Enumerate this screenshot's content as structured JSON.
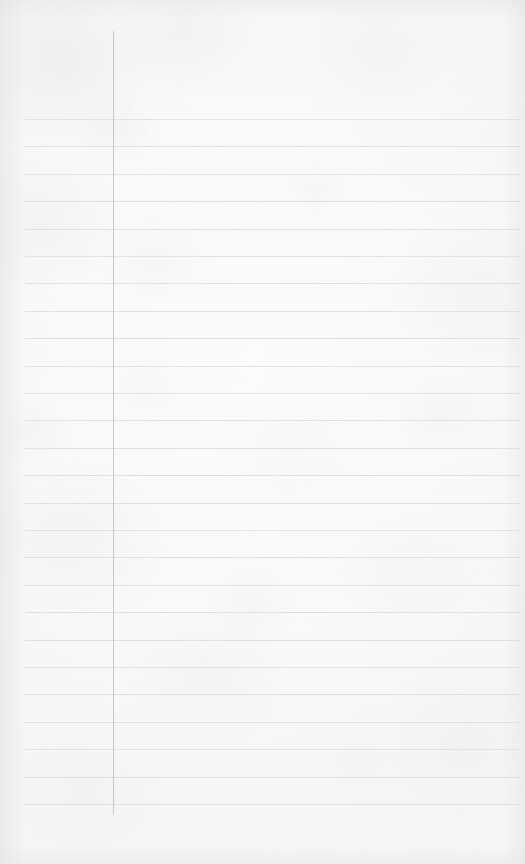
{
  "document": {
    "kind": "scanned-lined-notebook-paper",
    "title": "Blank ruled notebook page",
    "content_text": "",
    "visible_text_count": 0
  },
  "page": {
    "width": 525,
    "height": 864,
    "paper_color": "#fbfbfa",
    "paper_highlight": "#fdfdfd",
    "paper_shadow": "#f2f2f1"
  },
  "ruling": {
    "rule_color": "#d4d6d8",
    "rule_thickness": 1,
    "rule_left": 25,
    "rule_right": 520,
    "first_rule_y": 119,
    "line_spacing": 27.4,
    "line_count": 26,
    "lines_y": [
      119,
      146.4,
      173.8,
      201.2,
      228.6,
      256,
      283.4,
      310.8,
      338.2,
      365.6,
      393,
      420.4,
      447.8,
      475.2,
      502.6,
      530,
      557.4,
      584.8,
      612.2,
      639.6,
      667,
      694.4,
      721.8,
      749.2,
      776.6,
      804
    ]
  },
  "margin": {
    "margin_color": "#b9bcc0",
    "margin_thickness": 1,
    "margin_x": 113,
    "margin_top_y": 31,
    "margin_bottom_y": 815
  }
}
